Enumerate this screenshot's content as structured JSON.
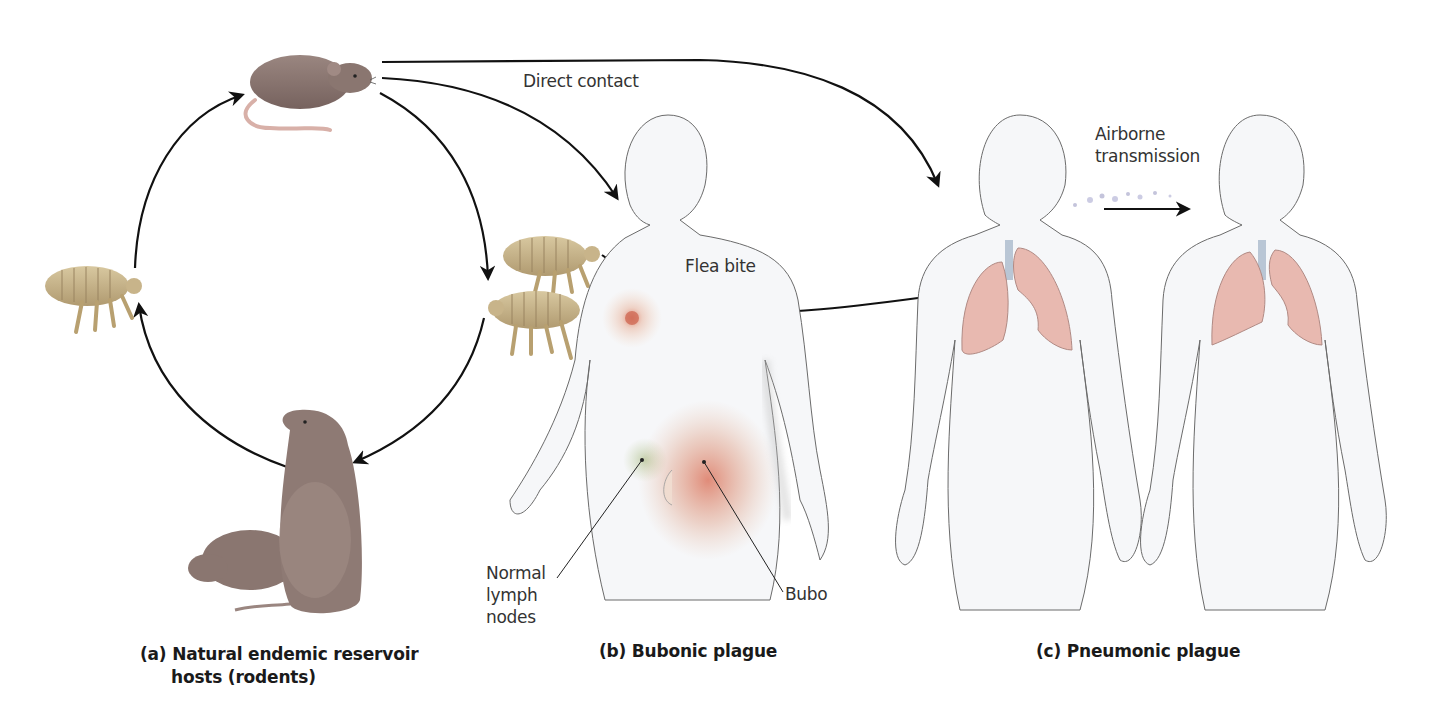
{
  "figure": {
    "panels": [
      {
        "id": "a",
        "caption_line1": "(a) Natural endemic reservoir",
        "caption_line2": "hosts (rodents)"
      },
      {
        "id": "b",
        "caption": "(b) Bubonic plague"
      },
      {
        "id": "c",
        "caption": "(c) Pneumonic plague"
      }
    ],
    "labels": {
      "direct_contact": "Direct contact",
      "flea_bite": "Flea bite",
      "airborne": "Airborne\ntransmission",
      "normal_lymph_nodes": "Normal\nlymph\nnodes",
      "bubo": "Bubo"
    },
    "icons": [
      "rat-icon",
      "flea-icon",
      "prairie-dog-icon",
      "human-figure-icon",
      "lungs-icon",
      "arrow-icon"
    ],
    "colors": {
      "arrow": "#111111",
      "rodent": "#8a7670",
      "flea": "#c8b48a",
      "lung": "#e8b9b0",
      "bubo": "#d9674e",
      "body_outline": "#6b6b6b",
      "body_fill": "#f6f7f9"
    }
  }
}
